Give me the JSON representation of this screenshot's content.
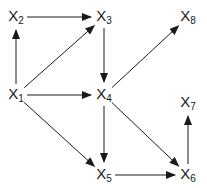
{
  "diagram": {
    "type": "directed-graph",
    "edge_color": "#1a1a1a",
    "nodes": [
      {
        "id": "X1",
        "base": "X",
        "sub": "1",
        "x": 16,
        "y": 95
      },
      {
        "id": "X2",
        "base": "X",
        "sub": "2",
        "x": 16,
        "y": 17
      },
      {
        "id": "X3",
        "base": "X",
        "sub": "3",
        "x": 104,
        "y": 17
      },
      {
        "id": "X4",
        "base": "X",
        "sub": "4",
        "x": 104,
        "y": 95
      },
      {
        "id": "X5",
        "base": "X",
        "sub": "5",
        "x": 104,
        "y": 175
      },
      {
        "id": "X6",
        "base": "X",
        "sub": "6",
        "x": 188,
        "y": 175
      },
      {
        "id": "X7",
        "base": "X",
        "sub": "7",
        "x": 188,
        "y": 103
      },
      {
        "id": "X8",
        "base": "X",
        "sub": "8",
        "x": 188,
        "y": 17
      }
    ],
    "edges": [
      {
        "from": "X1",
        "to": "X2"
      },
      {
        "from": "X2",
        "to": "X3"
      },
      {
        "from": "X1",
        "to": "X3"
      },
      {
        "from": "X3",
        "to": "X4"
      },
      {
        "from": "X1",
        "to": "X4"
      },
      {
        "from": "X4",
        "to": "X8"
      },
      {
        "from": "X1",
        "to": "X5"
      },
      {
        "from": "X4",
        "to": "X5"
      },
      {
        "from": "X4",
        "to": "X6"
      },
      {
        "from": "X5",
        "to": "X6"
      },
      {
        "from": "X6",
        "to": "X7"
      }
    ]
  }
}
